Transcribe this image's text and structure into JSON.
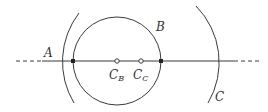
{
  "labels": {
    "A": "A",
    "B": "B",
    "C": "C",
    "CB_main": "C",
    "CB_sub": "B",
    "CC_main": "C",
    "CC_sub": "C"
  },
  "colors": {
    "stroke": "#3a3a3a",
    "background": "#ffffff"
  }
}
